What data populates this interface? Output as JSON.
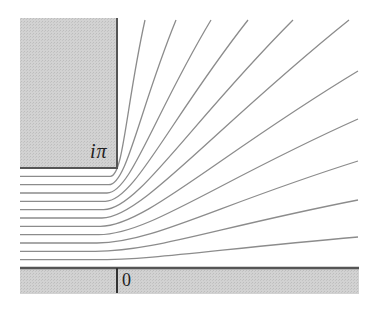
{
  "figure": {
    "labels": {
      "corner_label": "iπ",
      "origin_label": "0"
    },
    "streamlines": {
      "count": 11,
      "stream_values_in_units_of_pi": [
        0.0833,
        0.1667,
        0.25,
        0.3333,
        0.4167,
        0.5,
        0.5833,
        0.6667,
        0.75,
        0.8333,
        0.9167
      ],
      "exit_sides": [
        "right",
        "right",
        "right",
        "right",
        "right",
        "top",
        "top",
        "top",
        "top",
        "top",
        "top"
      ]
    },
    "colors": {
      "wall_fill": "#cdcdcd",
      "wall_edge": "#555555",
      "streamline": "#8c8c8c",
      "background": "#ffffff"
    }
  }
}
